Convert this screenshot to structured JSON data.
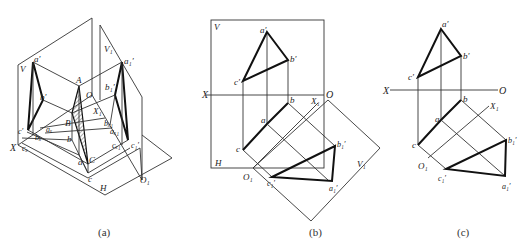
{
  "figure": {
    "panels": [
      {
        "id": "a",
        "caption": "(a)",
        "labels": {
          "V": "V",
          "V1": "V₁",
          "a_prime": "a′",
          "a1_prime": "a₁′",
          "A": "A",
          "O": "O",
          "b_prime": "b′",
          "b1_prime": "b₁′",
          "X1": "X₁",
          "B": "B",
          "c_prime": "c′",
          "ax": "aₓ",
          "b": "b",
          "bx1": "bₓ₁",
          "ax1": "aₓ₁",
          "X": "X",
          "cx": "cₓ",
          "cx1": "cₓ₁",
          "c1_prime": "c₁′",
          "a": "a",
          "C": "C",
          "c": "c",
          "H": "H",
          "O1": "O₁",
          "bx": "bₓ"
        }
      },
      {
        "id": "b",
        "caption": "(b)",
        "labels": {
          "V": "V",
          "a_prime": "a′",
          "b_prime": "b′",
          "c_prime": "c′",
          "X": "X",
          "O": "O",
          "b": "b",
          "X1": "X₁",
          "a": "a",
          "c": "c",
          "H": "H",
          "O1": "O₁",
          "c1_prime": "c₁′",
          "b1_prime": "b₁′",
          "a1_prime": "a₁′",
          "V1": "V₁"
        }
      },
      {
        "id": "c",
        "caption": "(c)",
        "labels": {
          "a_prime": "a′",
          "b_prime": "b′",
          "c_prime": "c′",
          "X": "X",
          "O": "O",
          "b": "b",
          "X1": "X₁",
          "a": "a",
          "c": "c",
          "O1": "O₁",
          "c1_prime": "c₁′",
          "b1_prime": "b₁′",
          "a1_prime": "a₁′"
        }
      }
    ]
  }
}
